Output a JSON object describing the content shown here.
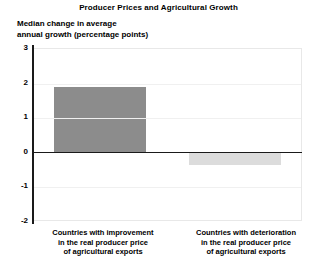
{
  "chart_data": {
    "type": "bar",
    "title": "Producer Prices and Agricultural Growth",
    "ylabel": "Median change in average\nannual growth (percentage points)",
    "xlabel": "",
    "ylim": [
      -2,
      3
    ],
    "yticks": [
      3,
      2,
      1,
      0,
      -1,
      -2
    ],
    "ytick_labels": [
      "3",
      "2",
      "1",
      "0",
      "-1",
      "-2"
    ],
    "grid": true,
    "legend": null,
    "categories": [
      "Countries with improvement\nin the real producer price\nof agricultural exports",
      "Countries with deterioration\nin the real producer price\nof agricultural exports"
    ],
    "values": [
      1.9,
      -0.35
    ],
    "colors": [
      "#8c8c8c",
      "#dcdcdc"
    ],
    "zero_line_color": "#1a1a1a",
    "axis_color": "#1a1a1a",
    "gridline_color": "#f0f0f0"
  }
}
